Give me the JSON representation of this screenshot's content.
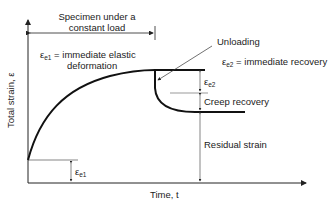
{
  "diagram": {
    "load_period_label_line1": "Specimen under a",
    "load_period_label_line2": "constant load",
    "ee1_def_symbol": "ε",
    "ee1_def_sub": "e1",
    "ee1_def_text_line1": " = immediate elastic",
    "ee1_def_text_line2": "deformation",
    "unloading_label": "Unloading",
    "ee2_def_symbol": "ε",
    "ee2_def_sub": "e2",
    "ee2_def_text": " = immediate recovery",
    "ee2_dim_symbol": "ε",
    "ee2_dim_sub": "e2",
    "creep_recovery_label": "Creep recovery",
    "residual_strain_label": "Residual strain",
    "ee1_dim_symbol": "ε",
    "ee1_dim_sub": "e1",
    "y_axis_label": "Total strain, ε",
    "x_axis_label": "Time, t"
  },
  "colors": {
    "line": "#111111",
    "thin": "#333333",
    "background": "#ffffff"
  }
}
